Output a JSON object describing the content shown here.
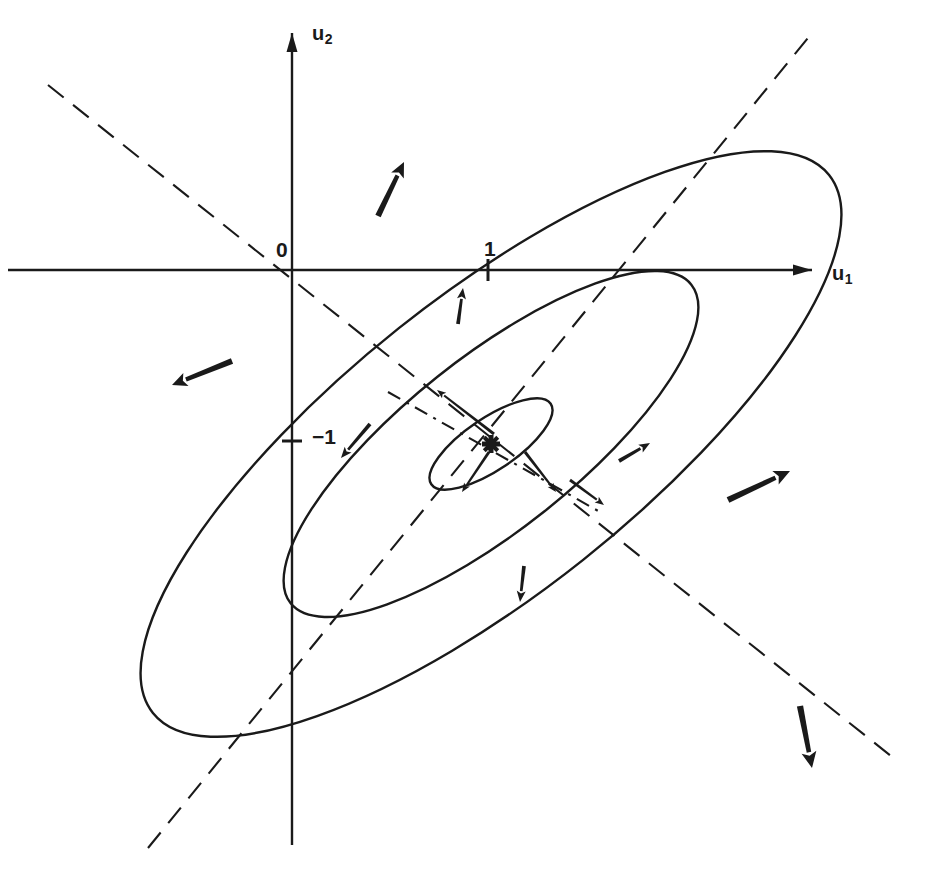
{
  "figure": {
    "kind": "contour-plot",
    "background_color": "#ffffff",
    "ink_color": "#1a1a1a"
  },
  "axes": {
    "horizontal": {
      "label": "u",
      "subscript": "1",
      "label_x": 832,
      "label_y": 262,
      "line": {
        "x1": 8,
        "y1": 270,
        "x2": 812,
        "y2": 270
      },
      "arrow_at": "end"
    },
    "vertical": {
      "label": "u",
      "subscript": "2",
      "label_x": 312,
      "label_y": 22,
      "line": {
        "x1": 292,
        "y1": 845,
        "x2": 292,
        "y2": 33
      },
      "arrow_at": "end"
    },
    "origin": {
      "label": "0",
      "x": 276,
      "y": 238,
      "cx": 292,
      "cy": 270
    }
  },
  "ticks": [
    {
      "name": "tick-positive-one",
      "label": "1",
      "axis": "horizontal",
      "x": 488,
      "y": 270,
      "label_x": 484,
      "label_y": 237
    },
    {
      "name": "tick-negative-one",
      "label": "−1",
      "axis": "vertical",
      "x": 292,
      "y": 441,
      "label_x": 312,
      "label_y": 425
    }
  ],
  "ellipses": {
    "center": {
      "x": 491,
      "y": 444
    },
    "rotation_deg": -38.5,
    "contours": [
      {
        "name": "outer-contour",
        "rx": 432,
        "ry": 148
      },
      {
        "name": "middle-contour",
        "rx": 256,
        "ry": 86
      },
      {
        "name": "inner-contour",
        "rx": 72,
        "ry": 26,
        "rotation_deg": -34
      }
    ]
  },
  "guide_lines": [
    {
      "name": "major-axis-dashed-line",
      "style": "dashed",
      "x1": 48,
      "y1": 85,
      "x2": 896,
      "y2": 760,
      "dash": "20 12"
    },
    {
      "name": "minor-axis-dashed-line",
      "style": "dashed",
      "x1": 148,
      "y1": 848,
      "x2": 812,
      "y2": 33,
      "dash": "20 12"
    },
    {
      "name": "inner-axis-dashdot-line",
      "style": "dash-dot",
      "x1": 388,
      "y1": 392,
      "x2": 600,
      "y2": 512,
      "dash": "14 7 3 7"
    }
  ],
  "center_marker": {
    "name": "center-cross-marker",
    "x": 491,
    "y": 444,
    "size": 9
  },
  "normal_arrows": [
    {
      "name": "arrow-outer-top",
      "bx": 378,
      "by": 216,
      "tx": 404,
      "ty": 162,
      "width": 7,
      "head": 15
    },
    {
      "name": "arrow-outer-left",
      "bx": 232,
      "by": 361,
      "tx": 172,
      "ty": 385,
      "width": 7,
      "head": 15
    },
    {
      "name": "arrow-outer-right",
      "bx": 728,
      "by": 500,
      "tx": 790,
      "ty": 471,
      "width": 7.5,
      "head": 16
    },
    {
      "name": "arrow-outer-bottom",
      "bx": 800,
      "by": 706,
      "tx": 812,
      "ty": 768,
      "width": 7.5,
      "head": 16
    },
    {
      "name": "arrow-middle-top",
      "bx": 458,
      "by": 324,
      "tx": 463,
      "ty": 288,
      "width": 4.5,
      "head": 11
    },
    {
      "name": "arrow-middle-right",
      "bx": 619,
      "by": 461,
      "tx": 650,
      "ty": 443,
      "width": 4.5,
      "head": 11
    },
    {
      "name": "arrow-middle-bottom",
      "bx": 524,
      "by": 566,
      "tx": 520,
      "ty": 602,
      "width": 4.5,
      "head": 11
    },
    {
      "name": "arrow-middle-lower-left",
      "bx": 370,
      "by": 424,
      "tx": 341,
      "ty": 458,
      "width": 4.5,
      "head": 11
    },
    {
      "name": "arrow-inner-upper",
      "bx": 494,
      "by": 434,
      "tx": 437,
      "ty": 390,
      "width": 3.5,
      "head": 9
    },
    {
      "name": "arrow-inner-lower",
      "bx": 489,
      "by": 452,
      "tx": 462,
      "ty": 492,
      "width": 3.5,
      "head": 9
    },
    {
      "name": "arrow-inner-right-down",
      "bx": 525,
      "by": 452,
      "tx": 556,
      "ty": 492,
      "width": 3.5,
      "head": 9
    },
    {
      "name": "arrow-inner-far-right",
      "bx": 570,
      "by": 480,
      "tx": 604,
      "ty": 505,
      "width": 3.5,
      "head": 9
    }
  ],
  "chart_data": {
    "type": "line",
    "title": "",
    "xlabel": "u1",
    "ylabel": "u2",
    "grid": false,
    "legend": false,
    "axis_tick_labels": {
      "x": [
        "0",
        "1"
      ],
      "y": [
        "0",
        "-1"
      ]
    },
    "contour_levels": 3,
    "center_point": [
      1.0,
      -1.0
    ],
    "principal_axis_angle_deg": -38.5
  }
}
